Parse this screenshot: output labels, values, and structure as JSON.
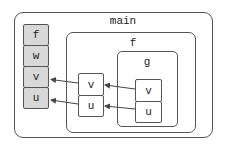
{
  "diagram": {
    "scopes": {
      "main": {
        "label": "main",
        "cells": [
          "f",
          "w",
          "v",
          "u"
        ]
      },
      "f": {
        "label": "f",
        "cells": [
          "v",
          "u"
        ]
      },
      "g": {
        "label": "g",
        "cells": [
          "v",
          "u"
        ]
      }
    },
    "arrows": [
      {
        "from": "f.v",
        "to": "main.v"
      },
      {
        "from": "f.u",
        "to": "main.u"
      },
      {
        "from": "g.v",
        "to": "f.v"
      },
      {
        "from": "g.u",
        "to": "f.u"
      }
    ],
    "colors": {
      "stroke": "#555555",
      "global_cell_fill": "#d8d8d8",
      "local_cell_fill": "#ffffff"
    }
  }
}
